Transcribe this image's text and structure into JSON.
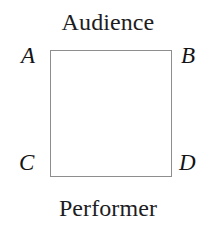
{
  "diagram": {
    "kind": "labeled-square-stage-diagram",
    "background_color": "#ffffff",
    "outline_color": "#8e8e8e",
    "text_color": "#1d1d1f",
    "side_labels": {
      "top": "Audience",
      "bottom": "Performer"
    },
    "vertices": [
      {
        "id": "a",
        "label": "A",
        "position": "top-left"
      },
      {
        "id": "b",
        "label": "B",
        "position": "top-right"
      },
      {
        "id": "c",
        "label": "C",
        "position": "bottom-left"
      },
      {
        "id": "d",
        "label": "D",
        "position": "bottom-right"
      }
    ]
  }
}
